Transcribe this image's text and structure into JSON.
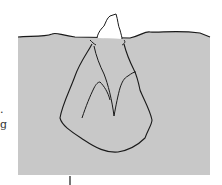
{
  "diagram": {
    "colors": {
      "water": "#c8c8c8",
      "line": "#1a1a1a",
      "background": "#ffffff"
    },
    "text_fragments": [
      ".",
      "g"
    ]
  }
}
